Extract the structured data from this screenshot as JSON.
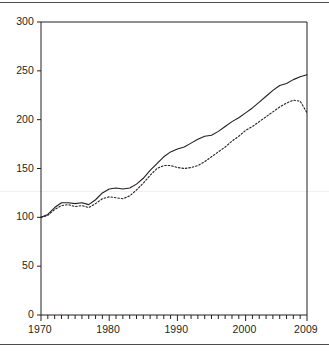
{
  "chart_data": {
    "type": "line",
    "title": "",
    "subtitle": "",
    "xlabel": "",
    "ylabel": "",
    "xlim": [
      1970,
      2009
    ],
    "ylim": [
      0,
      300
    ],
    "grid": false,
    "legend_position": "none",
    "y_ticks": [
      0,
      50,
      100,
      150,
      200,
      250,
      300
    ],
    "y_tick_labels": [
      "0",
      "50",
      "100",
      "150",
      "200",
      "250",
      "300"
    ],
    "x_tick_labels": [
      "1970",
      "1980",
      "1990",
      "2000",
      "2009"
    ],
    "x_tick_values": [
      1970,
      1980,
      1990,
      2000,
      2009
    ],
    "x_minor_tick_step": 1,
    "x": [
      1970,
      1971,
      1972,
      1973,
      1974,
      1975,
      1976,
      1977,
      1978,
      1979,
      1980,
      1981,
      1982,
      1983,
      1984,
      1985,
      1986,
      1987,
      1988,
      1989,
      1990,
      1991,
      1992,
      1993,
      1994,
      1995,
      1996,
      1997,
      1998,
      1999,
      2000,
      2001,
      2002,
      2003,
      2004,
      2005,
      2006,
      2007,
      2008,
      2009
    ],
    "series": [
      {
        "name": "solid-series",
        "style": "solid",
        "color": "#231f20",
        "values": [
          100,
          103,
          110,
          115,
          115,
          114,
          115,
          113,
          118,
          125,
          129,
          130,
          129,
          130,
          134,
          140,
          148,
          155,
          162,
          167,
          170,
          172,
          176,
          180,
          183,
          184,
          188,
          193,
          198,
          202,
          207,
          212,
          218,
          224,
          230,
          235,
          237,
          241,
          244,
          246
        ]
      },
      {
        "name": "dotted-series",
        "style": "dotted",
        "color": "#231f20",
        "values": [
          100,
          102,
          108,
          112,
          113,
          111,
          112,
          110,
          114,
          119,
          121,
          120,
          119,
          122,
          128,
          135,
          143,
          150,
          153,
          153,
          151,
          150,
          151,
          153,
          157,
          162,
          167,
          172,
          178,
          183,
          189,
          193,
          198,
          203,
          208,
          213,
          217,
          220,
          219,
          207
        ]
      }
    ]
  },
  "axes": {
    "y_axis_name": "value-axis",
    "x_axis_name": "year-axis"
  }
}
